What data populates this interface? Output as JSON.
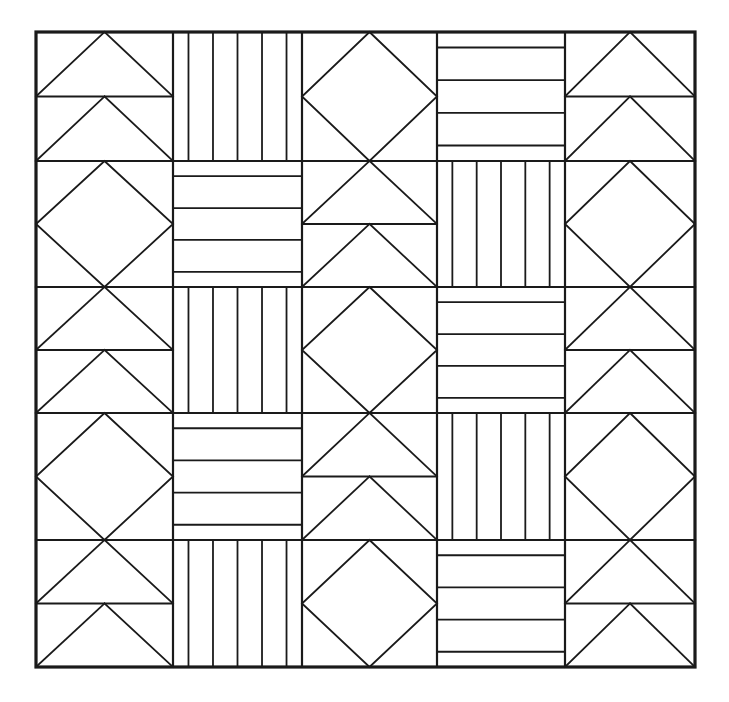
{
  "document": {
    "title": "Quilt Block Layout Diagram",
    "description": "Five by five grid of pieced quilt blocks drawn as black line art on white background",
    "background_color": "#ffffff",
    "line_color": "#1a1a1a"
  },
  "canvas": {
    "width": 729,
    "height": 702
  },
  "grid": {
    "rows": 5,
    "columns": 5,
    "x_positions": [
      36,
      173,
      302,
      437,
      565,
      695
    ],
    "y_positions": [
      32,
      161,
      287,
      413,
      540,
      667
    ],
    "outer_border_width": 3.2,
    "inner_line_width": 2.2,
    "detail_line_width": 1.8
  },
  "block_types": {
    "flying_geese": {
      "name": "flying-geese",
      "label": "Flying Geese",
      "description": "Two stacked triangles pointing upward, apex at top center of each half"
    },
    "vertical_bars": {
      "name": "vertical-bars",
      "label": "Vertical Bars",
      "description": "Four vertical bars formed by three internal vertical lines, inset from left and right edges",
      "internal_lines": 3,
      "inset_ratio": 0.12
    },
    "diamond": {
      "name": "diamond",
      "label": "Diamond on Point",
      "description": "Square rotated forty five degrees touching the midpoints of all four cell edges"
    },
    "horizontal_bars": {
      "name": "horizontal-bars",
      "label": "Horizontal Bars",
      "description": "Three horizontal bands formed by two internal horizontal lines, inset from top and bottom edges",
      "internal_lines": 2,
      "inset_ratio": 0.12
    }
  },
  "chart_data": {
    "type": "heatmap",
    "xlabel": "",
    "ylabel": "",
    "categories": [
      "col-1",
      "col-2",
      "col-3",
      "col-4",
      "col-5"
    ],
    "rows": [
      "row-1",
      "row-2",
      "row-3",
      "row-4",
      "row-5"
    ],
    "grid": true,
    "legend": "none",
    "cells": [
      [
        "flying_geese",
        "vertical_bars",
        "diamond",
        "horizontal_bars",
        "flying_geese"
      ],
      [
        "diamond",
        "horizontal_bars",
        "flying_geese",
        "vertical_bars",
        "diamond"
      ],
      [
        "flying_geese",
        "vertical_bars",
        "diamond",
        "horizontal_bars",
        "flying_geese"
      ],
      [
        "diamond",
        "horizontal_bars",
        "flying_geese",
        "vertical_bars",
        "diamond"
      ],
      [
        "flying_geese",
        "vertical_bars",
        "diamond",
        "horizontal_bars",
        "flying_geese"
      ]
    ]
  }
}
